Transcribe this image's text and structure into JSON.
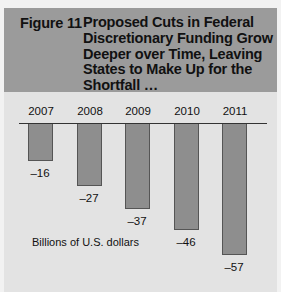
{
  "figure": {
    "label": "Figure 11",
    "title": "Proposed Cuts in Federal Discretionary Funding Grow Deeper over Time, Leaving States to Make Up for the Shortfall …"
  },
  "chart_data": {
    "type": "bar",
    "title": "Proposed Cuts in Federal Discretionary Funding Grow Deeper over Time, Leaving States to Make Up for the Shortfall …",
    "categories": [
      "2007",
      "2008",
      "2009",
      "2010",
      "2011"
    ],
    "values": [
      -16,
      -27,
      -37,
      -46,
      -57
    ],
    "value_labels": [
      "–16",
      "–27",
      "–37",
      "–46",
      "–57"
    ],
    "xlabel": "",
    "ylabel": "Billions of U.S. dollars",
    "ylim": [
      -60,
      0
    ],
    "grid": false,
    "legend": null,
    "bar_color": "#8e8e8e"
  },
  "annotations": {
    "unit_label": "Billions of U.S. dollars"
  }
}
